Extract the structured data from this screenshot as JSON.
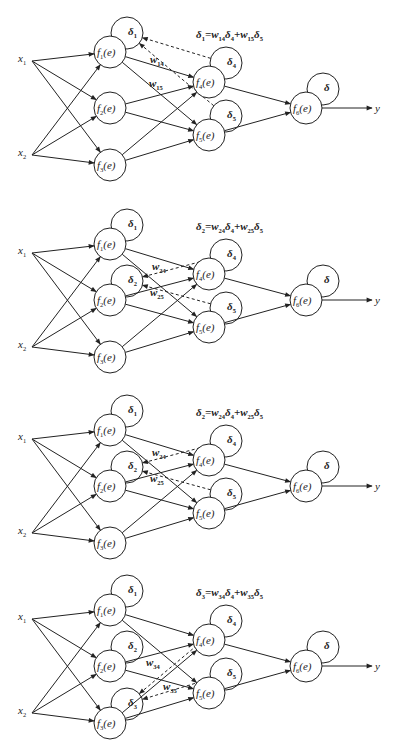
{
  "figure": {
    "colors": {
      "stroke": "#222222",
      "background": "#ffffff"
    }
  },
  "layout": {
    "node_radius": 16,
    "delta_radius": 16,
    "delta_offset": [
      17,
      -19
    ],
    "inputs": {
      "x1": [
        32,
        61
      ],
      "x2": [
        32,
        155
      ]
    },
    "nodes": {
      "f1": [
        110,
        52
      ],
      "f2": [
        110,
        108
      ],
      "f3": [
        110,
        165
      ],
      "f4": [
        209,
        82
      ],
      "f5": [
        209,
        135
      ],
      "f6": [
        306,
        108
      ]
    },
    "output_end": [
      372,
      108
    ],
    "formula_pos": [
      196,
      38
    ]
  },
  "panels": [
    {
      "id": "panel-1",
      "offset_y": 0,
      "formula": {
        "lhs": "δ1",
        "text": "δ1=w14δ4+w15δ5",
        "parts": [
          [
            "δ",
            "1"
          ],
          [
            "=",
            ""
          ],
          [
            "w",
            "14"
          ],
          [
            "δ",
            "4"
          ],
          [
            "+",
            ""
          ],
          [
            "w",
            "15"
          ],
          [
            "δ",
            "5"
          ]
        ]
      },
      "deltas": {
        "f1": "1",
        "f2": null,
        "f3": null,
        "f4": "4",
        "f5": "5",
        "f6": ""
      },
      "highlight": "f1",
      "weights": [
        {
          "label": "w",
          "sub": "14",
          "pos": [
            150,
            63
          ]
        },
        {
          "label": "w",
          "sub": "15",
          "pos": [
            149,
            87
          ]
        }
      ],
      "back_edges": [
        {
          "from": "f4",
          "to": "f1"
        },
        {
          "from": "f5",
          "to": "f1"
        }
      ]
    },
    {
      "id": "panel-2",
      "offset_y": 192,
      "formula": {
        "lhs": "δ2",
        "text": "δ2=w24δ4+w25δ5",
        "parts": [
          [
            "δ",
            "2"
          ],
          [
            "=",
            ""
          ],
          [
            "w",
            "24"
          ],
          [
            "δ",
            "4"
          ],
          [
            "+",
            ""
          ],
          [
            "w",
            "25"
          ],
          [
            "δ",
            "5"
          ]
        ]
      },
      "deltas": {
        "f1": "1",
        "f2": "2",
        "f3": null,
        "f4": "4",
        "f5": "5",
        "f6": ""
      },
      "highlight": "f2",
      "weights": [
        {
          "label": "w",
          "sub": "24",
          "pos": [
            152,
            78
          ]
        },
        {
          "label": "w",
          "sub": "25",
          "pos": [
            150,
            104
          ]
        }
      ],
      "back_edges": [
        {
          "from": "f4",
          "to": "f2"
        },
        {
          "from": "f5",
          "to": "f2"
        }
      ]
    },
    {
      "id": "panel-3",
      "offset_y": 378,
      "formula": {
        "lhs": "δ2",
        "text": "δ2=w24δ4+w25δ5",
        "parts": [
          [
            "δ",
            "2"
          ],
          [
            "=",
            ""
          ],
          [
            "w",
            "24"
          ],
          [
            "δ",
            "4"
          ],
          [
            "+",
            ""
          ],
          [
            "w",
            "25"
          ],
          [
            "δ",
            "5"
          ]
        ]
      },
      "deltas": {
        "f1": "1",
        "f2": "2",
        "f3": null,
        "f4": "4",
        "f5": "5",
        "f6": ""
      },
      "highlight": "f2",
      "weights": [
        {
          "label": "w",
          "sub": "24",
          "pos": [
            152,
            78
          ]
        },
        {
          "label": "w",
          "sub": "25",
          "pos": [
            150,
            104
          ]
        }
      ],
      "back_edges": [
        {
          "from": "f4",
          "to": "f2"
        },
        {
          "from": "f5",
          "to": "f2"
        }
      ]
    },
    {
      "id": "panel-4",
      "offset_y": 558,
      "formula": {
        "lhs": "δ3",
        "text": "δ3=w34δ4+w35δ5",
        "parts": [
          [
            "δ",
            "3"
          ],
          [
            "=",
            ""
          ],
          [
            "w",
            "34"
          ],
          [
            "δ",
            "4"
          ],
          [
            "+",
            ""
          ],
          [
            "w",
            "35"
          ],
          [
            "δ",
            "5"
          ]
        ]
      },
      "deltas": {
        "f1": "1",
        "f2": "2",
        "f3": "3",
        "f4": "4",
        "f5": "5",
        "f6": ""
      },
      "highlight": "f3",
      "weights": [
        {
          "label": "w",
          "sub": "34",
          "pos": [
            146,
            108
          ]
        },
        {
          "label": "w",
          "sub": "35",
          "pos": [
            163,
            132
          ]
        }
      ],
      "back_edges": [
        {
          "from": "f4",
          "to": "f3"
        },
        {
          "from": "f5",
          "to": "f3"
        }
      ]
    }
  ],
  "labels": {
    "x1": {
      "base": "x",
      "sub": "1"
    },
    "x2": {
      "base": "x",
      "sub": "2"
    },
    "y": "y",
    "node_fn": {
      "base": "f",
      "arg": "(e)"
    },
    "delta_symbol": "δ"
  }
}
